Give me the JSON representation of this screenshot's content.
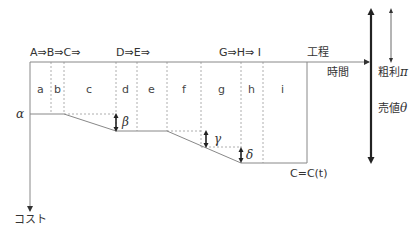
{
  "diagram": {
    "top_process_labels": [
      "A⇒B⇒C⇒",
      "D⇒E⇒",
      "G⇒H⇒ I"
    ],
    "axis_label_process": "工程",
    "axis_label_time": "時間",
    "axis_label_cost": "コスト",
    "cells": [
      "a",
      "b",
      "c",
      "d",
      "e",
      "f",
      "g",
      "h",
      "i"
    ],
    "greek": {
      "alpha": "α",
      "beta": "β",
      "gamma": "γ",
      "delta": "δ"
    },
    "right_labels": {
      "gross_profit": "粗利",
      "gross_profit_symbol": "π",
      "sales_value": "売値",
      "sales_value_symbol": "θ"
    },
    "cost_function_label": "C=C(t)",
    "colors": {
      "line": "#888888",
      "dashed": "#999999",
      "arrow": "#222222",
      "text": "#333333"
    }
  }
}
